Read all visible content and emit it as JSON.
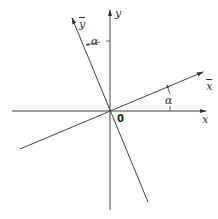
{
  "diagram": {
    "axes": {
      "x_label": "x",
      "y_label": "y",
      "xbar_label": "x",
      "ybar_label": "y",
      "origin_label": "0"
    },
    "angle_label_top": "α",
    "angle_label_right": "α",
    "colors": {
      "line": "#444444",
      "background": "#ffffff"
    }
  }
}
